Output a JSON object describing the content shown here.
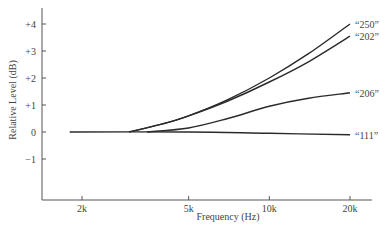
{
  "chart_data": {
    "type": "line",
    "title": "",
    "xlabel": "Frequency (Hz)",
    "ylabel": "Relative Level (dB)",
    "x_scale": "log",
    "xlim": [
      1500,
      24000
    ],
    "ylim": [
      -2.5,
      4.5
    ],
    "x_ticks": [
      {
        "value": 2000,
        "label": "2k"
      },
      {
        "value": 5000,
        "label": "5k"
      },
      {
        "value": 10000,
        "label": "10k"
      },
      {
        "value": 20000,
        "label": "20k"
      }
    ],
    "y_ticks": [
      {
        "value": 4,
        "label": "+4"
      },
      {
        "value": 3,
        "label": "+3"
      },
      {
        "value": 2,
        "label": "+2"
      },
      {
        "value": 1,
        "label": "+1"
      },
      {
        "value": 0,
        "label": "0"
      },
      {
        "value": -1,
        "label": "−1"
      }
    ],
    "grid": false,
    "legend": "inline labels at right end of each curve",
    "series": [
      {
        "name": "“250”",
        "x": [
          3000,
          4000,
          5000,
          7000,
          10000,
          14000,
          20000
        ],
        "y": [
          0.0,
          0.3,
          0.6,
          1.2,
          2.0,
          2.9,
          4.0
        ]
      },
      {
        "name": "“202”",
        "x": [
          3000,
          4000,
          5000,
          7000,
          10000,
          14000,
          20000
        ],
        "y": [
          0.0,
          0.3,
          0.6,
          1.15,
          1.85,
          2.6,
          3.55
        ]
      },
      {
        "name": "“206”",
        "x": [
          3500,
          5000,
          7000,
          10000,
          14000,
          20000
        ],
        "y": [
          0.0,
          0.15,
          0.5,
          0.95,
          1.25,
          1.45
        ]
      },
      {
        "name": "“111”",
        "x": [
          1800,
          5000,
          10000,
          20000
        ],
        "y": [
          0.0,
          0.0,
          -0.05,
          -0.1
        ]
      }
    ]
  }
}
